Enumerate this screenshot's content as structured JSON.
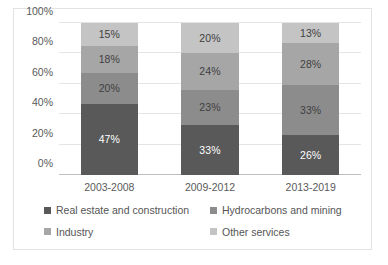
{
  "chart_data": {
    "type": "bar",
    "subtype": "100% stacked column",
    "title": "",
    "xlabel": "",
    "ylabel": "",
    "categories": [
      "2003-2008",
      "2009-2012",
      "2013-2019"
    ],
    "series": [
      {
        "name": "Real estate and construction",
        "color": "#595959",
        "label_color": "#ffffff",
        "values": [
          47,
          33,
          26
        ],
        "value_labels": [
          "47%",
          "33%",
          "26%"
        ]
      },
      {
        "name": "Hydrocarbons and mining",
        "color": "#8c8c8c",
        "label_color": "#3f3f3f",
        "values": [
          20,
          23,
          33
        ],
        "value_labels": [
          "20%",
          "23%",
          "33%"
        ]
      },
      {
        "name": "Industry",
        "color": "#a6a6a6",
        "label_color": "#3f3f3f",
        "values": [
          18,
          24,
          28
        ],
        "value_labels": [
          "18%",
          "24%",
          "28%"
        ]
      },
      {
        "name": "Other services",
        "color": "#c4c4c4",
        "label_color": "#3f3f3f",
        "values": [
          15,
          20,
          13
        ],
        "value_labels": [
          "15%",
          "20%",
          "13%"
        ]
      }
    ],
    "ylim": [
      0,
      100
    ],
    "ytick_values": [
      0,
      20,
      40,
      60,
      80,
      100
    ],
    "ytick_labels": [
      "0%",
      "20%",
      "40%",
      "60%",
      "80%",
      "100%"
    ],
    "grid": true,
    "grid_axis": "y",
    "legend_position": "bottom",
    "legend_columns": 2
  },
  "axis": {
    "yticks": [
      {
        "label": "100%",
        "value": 100
      },
      {
        "label": "80%",
        "value": 80
      },
      {
        "label": "60%",
        "value": 60
      },
      {
        "label": "40%",
        "value": 40
      },
      {
        "label": "20%",
        "value": 20
      },
      {
        "label": "0%",
        "value": 0
      }
    ]
  },
  "bars": [
    {
      "category": "2003-2008",
      "segments": [
        {
          "series": "Real estate and construction",
          "value": 47,
          "label": "47%",
          "color": "#595959",
          "text_tone": "on-dark"
        },
        {
          "series": "Hydrocarbons and mining",
          "value": 20,
          "label": "20%",
          "color": "#8c8c8c",
          "text_tone": "on-light"
        },
        {
          "series": "Industry",
          "value": 18,
          "label": "18%",
          "color": "#a6a6a6",
          "text_tone": "on-light"
        },
        {
          "series": "Other services",
          "value": 15,
          "label": "15%",
          "color": "#c4c4c4",
          "text_tone": "on-light"
        }
      ]
    },
    {
      "category": "2009-2012",
      "segments": [
        {
          "series": "Real estate and construction",
          "value": 33,
          "label": "33%",
          "color": "#595959",
          "text_tone": "on-dark"
        },
        {
          "series": "Hydrocarbons and mining",
          "value": 23,
          "label": "23%",
          "color": "#8c8c8c",
          "text_tone": "on-light"
        },
        {
          "series": "Industry",
          "value": 24,
          "label": "24%",
          "color": "#a6a6a6",
          "text_tone": "on-light"
        },
        {
          "series": "Other services",
          "value": 20,
          "label": "20%",
          "color": "#c4c4c4",
          "text_tone": "on-light"
        }
      ]
    },
    {
      "category": "2013-2019",
      "segments": [
        {
          "series": "Real estate and construction",
          "value": 26,
          "label": "26%",
          "color": "#595959",
          "text_tone": "on-dark"
        },
        {
          "series": "Hydrocarbons and mining",
          "value": 33,
          "label": "33%",
          "color": "#8c8c8c",
          "text_tone": "on-light"
        },
        {
          "series": "Industry",
          "value": 28,
          "label": "28%",
          "color": "#a6a6a6",
          "text_tone": "on-light"
        },
        {
          "series": "Other services",
          "value": 13,
          "label": "13%",
          "color": "#c4c4c4",
          "text_tone": "on-light"
        }
      ]
    }
  ],
  "legend": {
    "items": [
      {
        "label": "Real estate and construction",
        "color": "#595959"
      },
      {
        "label": "Hydrocarbons and mining",
        "color": "#8c8c8c"
      },
      {
        "label": "Industry",
        "color": "#a6a6a6"
      },
      {
        "label": "Other services",
        "color": "#c4c4c4"
      }
    ]
  },
  "colors": {
    "plot_border": "#e2e2e2",
    "gridline": "#e4e4e4",
    "axis_line": "#bfbfbf",
    "tick_text": "#5a5a5a",
    "legend_text": "#555555",
    "background": "#ffffff"
  }
}
